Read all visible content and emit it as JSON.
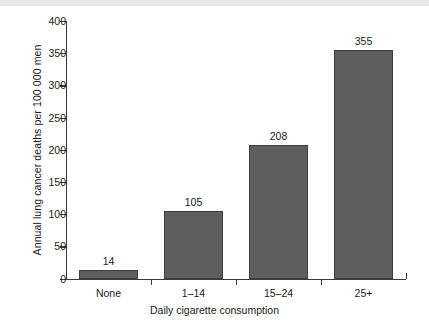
{
  "chart_data": {
    "type": "bar",
    "title": "",
    "subtitle": "",
    "xlabel": "Daily cigarette consumption",
    "ylabel": "Annual lung cancer deaths per 100 000 men",
    "categories": [
      "None",
      "1–14",
      "15–24",
      "25+"
    ],
    "values": [
      14,
      105,
      208,
      355
    ],
    "value_labels": [
      "14",
      "105",
      "208",
      "355"
    ],
    "series": [
      {
        "name": "Annual lung cancer deaths per 100 000 men",
        "values": [
          14,
          105,
          208,
          355
        ]
      }
    ],
    "ylim": [
      0,
      400
    ],
    "yticks": [
      0,
      50,
      100,
      150,
      200,
      250,
      300,
      350,
      400
    ],
    "ytick_labels": [
      "0",
      "50",
      "100",
      "150",
      "200",
      "250",
      "300",
      "350",
      "400"
    ],
    "grid": false,
    "legend": false,
    "legend_position": "none",
    "bar_color": "#5e5e5e",
    "bar_edge_color": "#3d3d3d",
    "axis_color": "#3a3a3a",
    "background_color": "#ffffff",
    "text_color": "#1a1a1a",
    "data_labels_shown": true
  }
}
